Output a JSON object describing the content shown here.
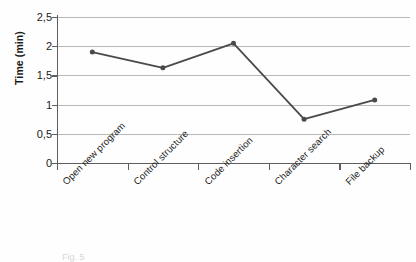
{
  "chart_data": {
    "type": "line",
    "title": "",
    "xlabel": "",
    "ylabel": "Time (min)",
    "categories": [
      "Open new program",
      "Control structure",
      "Code insertion",
      "Character search",
      "File backup"
    ],
    "values": [
      1.9,
      1.63,
      2.05,
      0.75,
      1.08
    ],
    "series": [
      {
        "name": "Time",
        "values": [
          1.9,
          1.63,
          2.05,
          0.75,
          1.08
        ]
      }
    ],
    "ylim": [
      0,
      2.5
    ],
    "ytick_labels": [
      "0",
      "0,5",
      "1",
      "1,5",
      "2",
      "2,5"
    ],
    "ytick_values": [
      0,
      0.5,
      1,
      1.5,
      2,
      2.5
    ],
    "grid": true,
    "legend": false,
    "legend_position": "none",
    "decimal_separator": ",",
    "series_color": "#4a4a4a",
    "gridline_color": "#b9b9b9",
    "axis_color": "#5e5e5e",
    "xlabel_rotation": -45
  },
  "caption": {
    "text": "Fig. 5"
  }
}
